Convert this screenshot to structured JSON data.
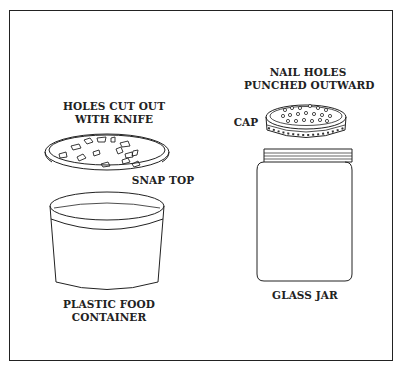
{
  "figure": {
    "left_item": {
      "title": "PLASTIC FOOD CONTAINER",
      "name_line1": "PLASTIC FOOD",
      "name_line2": "CONTAINER",
      "lid_label": "SNAP TOP",
      "holes_label_line1": "HOLES CUT OUT",
      "holes_label_line2": "WITH KNIFE"
    },
    "right_item": {
      "title": "GLASS JAR",
      "name": "GLASS JAR",
      "cap_label": "CAP",
      "holes_label_line1": "NAIL HOLES",
      "holes_label_line2": "PUNCHED OUTWARD"
    },
    "colors": {
      "line": "#222222",
      "background": "#ffffff"
    }
  }
}
